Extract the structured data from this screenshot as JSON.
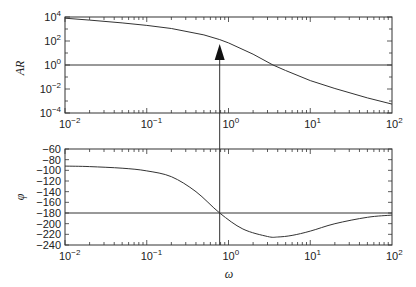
{
  "chart_data": [
    {
      "type": "line",
      "title": "",
      "xlabel": "",
      "ylabel": "AR",
      "xscale": "log",
      "yscale": "log",
      "xlim": [
        0.01,
        100
      ],
      "ylim": [
        0.0001,
        10000
      ],
      "xticks": [
        "10^-2",
        "10^-1",
        "10^0",
        "10^1",
        "10^2"
      ],
      "yticks": [
        "10^4",
        "10^2",
        "10^0",
        "10^-2",
        "10^-4"
      ],
      "grid": false,
      "series": [
        {
          "name": "AR",
          "x": [
            0.01,
            0.02,
            0.05,
            0.1,
            0.2,
            0.5,
            0.78,
            1,
            2,
            3.5,
            5,
            10,
            20,
            50,
            100
          ],
          "y": [
            8000,
            5500,
            3200,
            2000,
            1100,
            320,
            130,
            70,
            8,
            1,
            0.35,
            0.05,
            0.011,
            0.0018,
            0.00055
          ]
        }
      ],
      "reference_lines": [
        {
          "orientation": "horizontal",
          "value": 1
        }
      ],
      "annotations": [
        {
          "type": "arrow",
          "x": 0.78,
          "direction": "up",
          "from_phase_crossover_to_AR_curve": true
        }
      ]
    },
    {
      "type": "line",
      "title": "",
      "xlabel": "ω",
      "ylabel": "φ",
      "xscale": "log",
      "xlim": [
        0.01,
        100
      ],
      "ylim": [
        -240,
        -60
      ],
      "xticks": [
        "10^-2",
        "10^-1",
        "10^0",
        "10^1",
        "10^2"
      ],
      "yticks": [
        -60,
        -80,
        -100,
        -120,
        -140,
        -160,
        -180,
        -200,
        -220,
        -240
      ],
      "grid": false,
      "series": [
        {
          "name": "phi",
          "x": [
            0.01,
            0.02,
            0.05,
            0.1,
            0.2,
            0.4,
            0.78,
            1.5,
            3,
            4,
            6,
            10,
            20,
            50,
            100
          ],
          "y": [
            -92,
            -93,
            -96,
            -101,
            -112,
            -140,
            -180,
            -210,
            -224,
            -225,
            -222,
            -214,
            -200,
            -188,
            -184
          ]
        }
      ],
      "reference_lines": [
        {
          "orientation": "horizontal",
          "value": -180
        },
        {
          "orientation": "vertical",
          "value": 0.78
        }
      ]
    }
  ],
  "labels": {
    "ar_axis": "AR",
    "phi_axis": "φ",
    "omega_axis": "ω"
  }
}
